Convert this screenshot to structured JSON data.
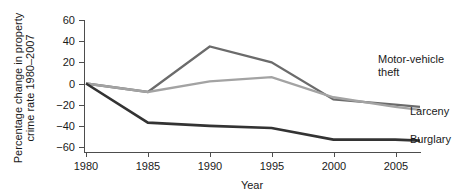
{
  "chart_data": {
    "type": "line",
    "title": "",
    "xlabel": "Year",
    "ylabel": "Percentage change in property crime rate 1980–2007",
    "ylabel_line1": "Percentage change in property",
    "ylabel_line2": "crime rate 1980–2007",
    "x": [
      1980,
      1985,
      1990,
      1995,
      2000,
      2005,
      2007
    ],
    "xticks": [
      "1980",
      "1985",
      "1990",
      "1995",
      "2000",
      "2005"
    ],
    "xtick_values": [
      1980,
      1985,
      1990,
      1995,
      2000,
      2005
    ],
    "yticks": [
      "60",
      "40",
      "20",
      "0",
      "−20",
      "−40",
      "−60"
    ],
    "ytick_values": [
      60,
      40,
      20,
      0,
      -20,
      -40,
      -60
    ],
    "xlim": [
      1980,
      2007
    ],
    "ylim": [
      -60,
      60
    ],
    "grid": false,
    "legend_position": "right-inline-labels",
    "series": [
      {
        "name": "Motor-vehicle theft",
        "label_line1": "Motor-vehicle",
        "label_line2": "theft",
        "color": "#6b6b6b",
        "values": [
          0,
          -8,
          35,
          20,
          -15,
          -20,
          -22
        ]
      },
      {
        "name": "Larceny",
        "label_line1": "Larceny",
        "label_line2": "",
        "color": "#a3a3a3",
        "values": [
          0,
          -8,
          2,
          6,
          -13,
          -22,
          -25
        ]
      },
      {
        "name": "Burglary",
        "label_line1": "Burglary",
        "label_line2": "",
        "color": "#333333",
        "values": [
          0,
          -37,
          -40,
          -42,
          -53,
          -53,
          -54
        ]
      }
    ]
  },
  "colors": {
    "background": "#ffffff",
    "axis": "#4d4d4d",
    "text": "#1a1a1a",
    "motor_vehicle_theft": "#6b6b6b",
    "larceny": "#a3a3a3",
    "burglary": "#333333"
  }
}
